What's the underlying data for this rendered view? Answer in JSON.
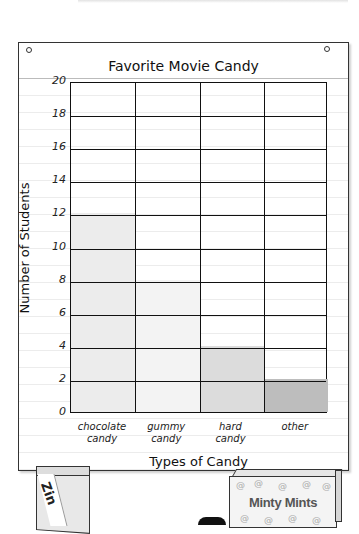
{
  "chart_data": {
    "type": "bar",
    "title": "Favorite Movie Candy",
    "xlabel": "Types of Candy",
    "ylabel": "Number of Students",
    "categories": [
      "chocolate candy",
      "gummy candy",
      "hard candy",
      "other"
    ],
    "category_lines": [
      [
        "chocolate",
        "candy"
      ],
      [
        "gummy",
        "candy"
      ],
      [
        "hard",
        "candy"
      ],
      [
        "other",
        ""
      ]
    ],
    "values": [
      12,
      8,
      4,
      2
    ],
    "ylim": [
      0,
      20
    ],
    "yticks": [
      "0",
      "2",
      "4",
      "6",
      "8",
      "10",
      "12",
      "14",
      "16",
      "18",
      "20"
    ],
    "grid": true,
    "bar_colors": [
      "#ececec",
      "#f3f3f3",
      "#dcdcdc",
      "#bdbdbd"
    ],
    "legend": null
  },
  "decorations": {
    "left_box_label": "Zin",
    "right_box_label": "Minty Mints"
  }
}
